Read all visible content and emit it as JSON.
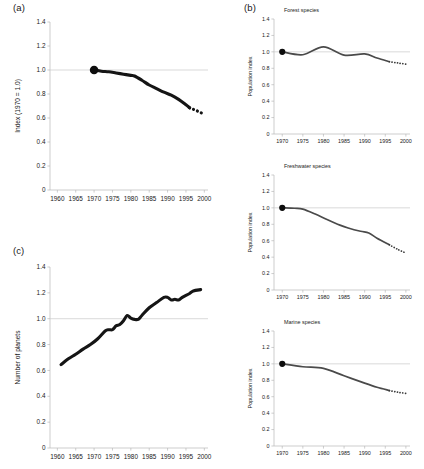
{
  "figure": {
    "panel_a_label": "(a)",
    "panel_b_label": "(b)",
    "panel_c_label": "(c)"
  },
  "chart_data": [
    {
      "id": "living-planet-index",
      "panel": "(a)",
      "type": "line",
      "title": "",
      "xlabel": "",
      "ylabel": "Index (1970 = 1.0)",
      "xlim": [
        1958,
        2001
      ],
      "ylim": [
        0,
        1.4
      ],
      "xticks": [
        1960,
        1965,
        1970,
        1975,
        1980,
        1985,
        1990,
        1995,
        2000
      ],
      "yticks": [
        "0",
        "0.2",
        "0.4",
        "0.6",
        "0.8",
        "1.0",
        "1.2",
        "1.4"
      ],
      "ytick_values": [
        0,
        0.2,
        0.4,
        0.6,
        0.8,
        1.0,
        1.2,
        1.4
      ],
      "reference_line": 1.0,
      "grid": false,
      "legend": "none",
      "start_marker": {
        "x": 1970,
        "y": 1.0
      },
      "series": [
        {
          "name": "Living Planet Index (observed)",
          "style": "solid-thick",
          "x": [
            1970,
            1972,
            1974,
            1976,
            1978,
            1980,
            1981,
            1983,
            1985,
            1987,
            1989,
            1991,
            1993,
            1995,
            1996
          ],
          "values": [
            1.0,
            0.99,
            0.985,
            0.975,
            0.965,
            0.955,
            0.95,
            0.915,
            0.875,
            0.845,
            0.815,
            0.79,
            0.755,
            0.71,
            0.685
          ]
        },
        {
          "name": "Living Planet Index (projected)",
          "style": "dotted-thick",
          "x": [
            1996,
            1997,
            1998,
            1999,
            2000
          ],
          "values": [
            0.685,
            0.672,
            0.66,
            0.645,
            0.632
          ]
        }
      ]
    },
    {
      "id": "forest-species",
      "panel": "(b)",
      "type": "line",
      "title": "Forest species",
      "xlabel": "",
      "ylabel": "Population index",
      "xlim": [
        1968,
        2001
      ],
      "ylim": [
        0,
        1.4
      ],
      "xticks": [
        1970,
        1975,
        1980,
        1985,
        1990,
        1995,
        2000
      ],
      "yticks": [
        "0",
        "0.2",
        "0.4",
        "0.6",
        "0.8",
        "1.0",
        "1.2",
        "1.4"
      ],
      "ytick_values": [
        0,
        0.2,
        0.4,
        0.6,
        0.8,
        1.0,
        1.2,
        1.4
      ],
      "reference_line": 1.0,
      "grid": false,
      "legend": "none",
      "start_marker": {
        "x": 1970,
        "y": 1.0
      },
      "series": [
        {
          "name": "Forest species index (observed)",
          "style": "solid-thin",
          "x": [
            1970,
            1975,
            1980,
            1985,
            1990,
            1993,
            1996
          ],
          "values": [
            1.0,
            0.965,
            1.06,
            0.96,
            0.975,
            0.925,
            0.88
          ]
        },
        {
          "name": "Forest species index (projected)",
          "style": "dotted-thin",
          "x": [
            1996,
            1998,
            2000
          ],
          "values": [
            0.88,
            0.865,
            0.85
          ]
        }
      ]
    },
    {
      "id": "freshwater-species",
      "panel": "(b)",
      "type": "line",
      "title": "Freshwater species",
      "xlabel": "",
      "ylabel": "Population index",
      "xlim": [
        1968,
        2001
      ],
      "ylim": [
        0,
        1.4
      ],
      "xticks": [
        1970,
        1975,
        1980,
        1985,
        1990,
        1995,
        2000
      ],
      "yticks": [
        "0",
        "0.2",
        "0.4",
        "0.6",
        "0.8",
        "1.0",
        "1.2",
        "1.4"
      ],
      "ytick_values": [
        0,
        0.2,
        0.4,
        0.6,
        0.8,
        1.0,
        1.2,
        1.4
      ],
      "reference_line": 1.0,
      "grid": false,
      "legend": "none",
      "start_marker": {
        "x": 1970,
        "y": 1.0
      },
      "series": [
        {
          "name": "Freshwater species index (observed)",
          "style": "solid-thin",
          "x": [
            1970,
            1973,
            1975,
            1978,
            1981,
            1984,
            1986,
            1989,
            1991,
            1993,
            1996
          ],
          "values": [
            1.0,
            0.995,
            0.985,
            0.925,
            0.855,
            0.79,
            0.755,
            0.715,
            0.695,
            0.63,
            0.55
          ]
        },
        {
          "name": "Freshwater species index (projected)",
          "style": "dotted-thin",
          "x": [
            1996,
            1998,
            2000
          ],
          "values": [
            0.55,
            0.495,
            0.45
          ]
        }
      ]
    },
    {
      "id": "marine-species",
      "panel": "(b)",
      "type": "line",
      "title": "Marine species",
      "xlabel": "",
      "ylabel": "Population index",
      "xlim": [
        1968,
        2001
      ],
      "ylim": [
        0,
        1.4
      ],
      "xticks": [
        1970,
        1975,
        1980,
        1985,
        1990,
        1995,
        2000
      ],
      "yticks": [
        "0",
        "0.2",
        "0.4",
        "0.6",
        "0.8",
        "1.0",
        "1.2",
        "1.4"
      ],
      "ytick_values": [
        0,
        0.2,
        0.4,
        0.6,
        0.8,
        1.0,
        1.2,
        1.4
      ],
      "reference_line": 1.0,
      "grid": false,
      "legend": "none",
      "start_marker": {
        "x": 1970,
        "y": 1.0
      },
      "series": [
        {
          "name": "Marine species index (observed)",
          "style": "solid-thin",
          "x": [
            1970,
            1975,
            1980,
            1985,
            1990,
            1993,
            1996
          ],
          "values": [
            1.0,
            0.965,
            0.945,
            0.855,
            0.765,
            0.715,
            0.675
          ]
        },
        {
          "name": "Marine species index (projected)",
          "style": "dotted-thin",
          "x": [
            1996,
            1998,
            2000
          ],
          "values": [
            0.675,
            0.655,
            0.64
          ]
        }
      ]
    },
    {
      "id": "ecological-footprint",
      "panel": "(c)",
      "type": "line",
      "title": "",
      "xlabel": "",
      "ylabel": "Number of planets",
      "xlim": [
        1958,
        2001
      ],
      "ylim": [
        0,
        1.4
      ],
      "xticks": [
        1960,
        1965,
        1970,
        1975,
        1980,
        1985,
        1990,
        1995,
        2000
      ],
      "yticks": [
        "0",
        "0.2",
        "0.4",
        "0.6",
        "0.8",
        "1.0",
        "1.2",
        "1.4"
      ],
      "ytick_values": [
        0,
        0.2,
        0.4,
        0.6,
        0.8,
        1.0,
        1.2,
        1.4
      ],
      "reference_line": 1.0,
      "grid": false,
      "legend": "none",
      "start_marker": null,
      "series": [
        {
          "name": "Number of planets required",
          "style": "solid-thick",
          "x": [
            1961,
            1963,
            1965,
            1967,
            1969,
            1971,
            1973,
            1974,
            1975,
            1976,
            1977,
            1978,
            1979,
            1980,
            1981,
            1982,
            1983,
            1985,
            1987,
            1989,
            1990,
            1991,
            1992,
            1993,
            1994,
            1996,
            1997,
            1999
          ],
          "values": [
            0.645,
            0.69,
            0.725,
            0.765,
            0.8,
            0.845,
            0.905,
            0.915,
            0.915,
            0.945,
            0.955,
            0.985,
            1.025,
            1.005,
            0.995,
            0.995,
            1.025,
            1.085,
            1.125,
            1.165,
            1.165,
            1.145,
            1.15,
            1.145,
            1.165,
            1.195,
            1.215,
            1.225
          ]
        }
      ]
    }
  ]
}
